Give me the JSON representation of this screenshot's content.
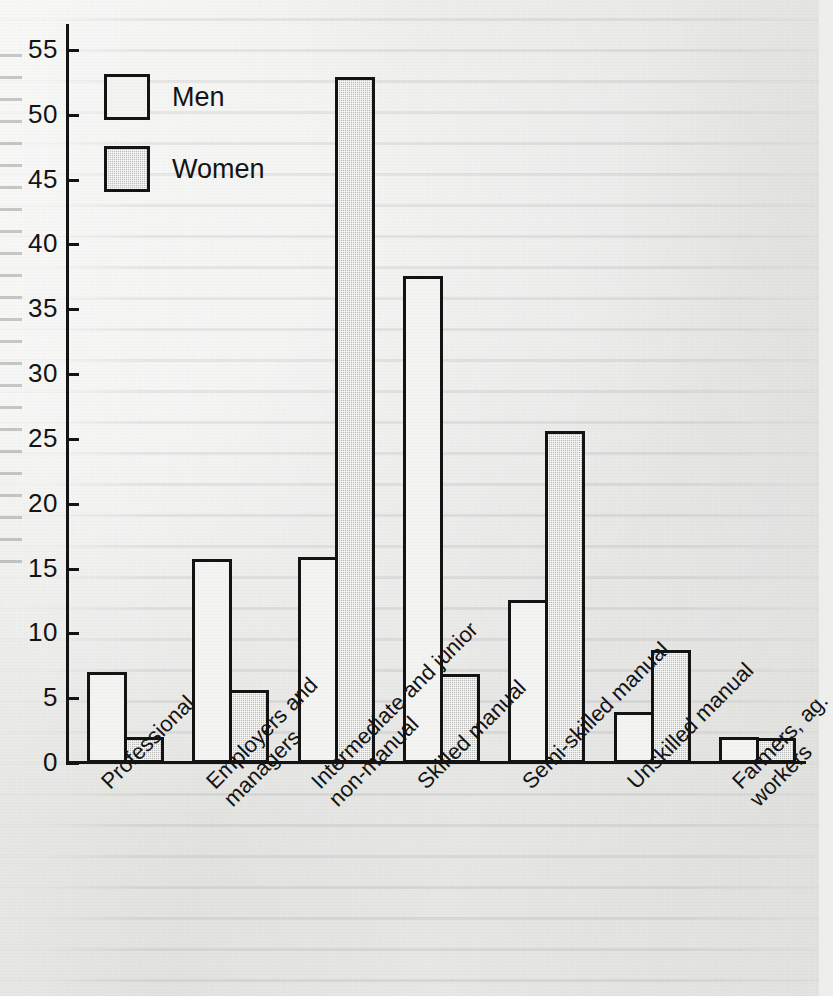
{
  "chart_data": {
    "type": "bar",
    "title": "",
    "subtitle": "",
    "xlabel": "",
    "ylabel": "",
    "categories": [
      "Professional",
      "Employers and\nmanagers",
      "Intermediate and junior\nnon-manual",
      "Skilled manual",
      "Semi-skilled manual",
      "Unskilled manual",
      "Farmers, ag.\nworkers"
    ],
    "series": [
      {
        "name": "Men",
        "values": [
          7.0,
          15.7,
          15.9,
          37.6,
          12.6,
          3.9,
          2.0
        ]
      },
      {
        "name": "Women",
        "values": [
          2.0,
          5.6,
          52.9,
          6.9,
          25.6,
          8.7,
          1.9
        ]
      }
    ],
    "ylim": [
      0,
      57
    ],
    "ytick_step": 5,
    "yticks": [
      0,
      5,
      10,
      15,
      20,
      25,
      30,
      35,
      40,
      45,
      50,
      55
    ],
    "ytick_labels": [
      "0",
      "5",
      "10",
      "15",
      "20",
      "25",
      "30",
      "35",
      "40",
      "45",
      "50",
      "55"
    ],
    "grid": false,
    "legend_position": "top-left",
    "bar_label_rotation": -45
  },
  "legend": {
    "entries": [
      {
        "label": "Men",
        "swatch": "hollow-white-square"
      },
      {
        "label": "Women",
        "swatch": "gray-halftone-square"
      }
    ]
  },
  "colors": {
    "men_fill": "#f4f4f2",
    "women_fill": "#bdbdbb",
    "outline": "#141414",
    "paper": "#eeeeec",
    "text": "#141414"
  }
}
